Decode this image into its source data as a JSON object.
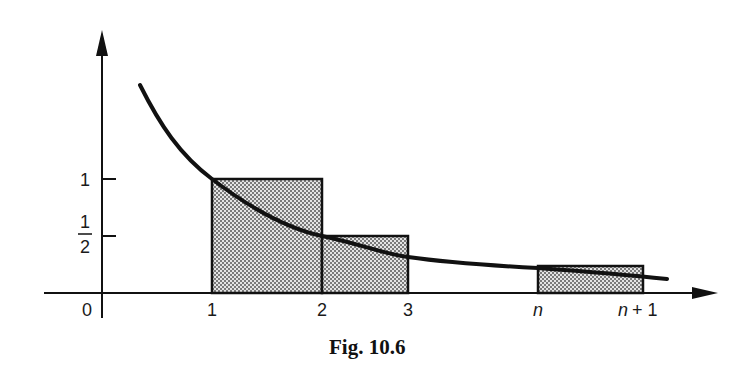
{
  "figure": {
    "caption": "Fig. 10.6",
    "x_axis": {
      "origin_label": "0",
      "tick_labels": [
        "1",
        "2",
        "3",
        "n",
        "n + 1"
      ]
    },
    "y_axis": {
      "tick_labels": [
        "1"
      ],
      "half_numerator": "1",
      "half_denominator": "2"
    },
    "curve": "y = 1/x (decreasing curve)",
    "rectangles": [
      {
        "from": "1",
        "to": "2",
        "height": "1"
      },
      {
        "from": "2",
        "to": "3",
        "height": "1/2"
      },
      {
        "from": "n",
        "to": "n + 1",
        "height": "1/n"
      }
    ],
    "colors": {
      "ink": "#111111",
      "fill_pattern": "#9a9a9a"
    }
  }
}
